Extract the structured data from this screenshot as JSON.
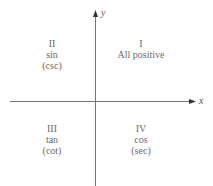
{
  "axes": {
    "x_label": "x",
    "y_label": "y",
    "line_color": "#777777"
  },
  "quadrants": [
    {
      "numeral": "I",
      "lines": [
        "All positive"
      ]
    },
    {
      "numeral": "II",
      "lines": [
        "sin",
        "(csc)"
      ]
    },
    {
      "numeral": "III",
      "lines": [
        "tan",
        "(cot)"
      ]
    },
    {
      "numeral": "IV",
      "lines": [
        "cos",
        "(sec)"
      ]
    }
  ]
}
